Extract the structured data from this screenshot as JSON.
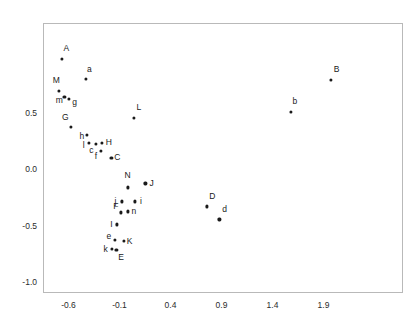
{
  "chart_data": {
    "type": "scatter",
    "title": "",
    "subtitle": "",
    "xlabel": "",
    "ylabel": "",
    "xlim": [
      -0.85,
      2.68
    ],
    "ylim": [
      -1.1,
      1.3
    ],
    "xticks": [
      -0.6,
      -0.1,
      0.4,
      0.9,
      1.4,
      1.9
    ],
    "xticklabels": [
      "-0.6",
      "-0.1",
      "0.4",
      "0.9",
      "1.4",
      "1.9"
    ],
    "yticks": [
      0.5,
      0.0,
      -0.5,
      -1.0
    ],
    "yticklabels": [
      "0.5",
      "0.0",
      "-0.5",
      "-1.0"
    ],
    "grid": false,
    "legend": null,
    "marker": "filled-circle",
    "marker_color": "#1a1a1a",
    "frame_color": "#b9b9b9",
    "points": [
      {
        "label": "A",
        "x": -0.665,
        "y": 0.982,
        "lx": -0.62,
        "ly": 1.08
      },
      {
        "label": "a",
        "x": -0.43,
        "y": 0.804,
        "lx": -0.395,
        "ly": 0.893
      },
      {
        "label": "M",
        "x": -0.695,
        "y": 0.697,
        "lx": -0.72,
        "ly": 0.795
      },
      {
        "label": "m",
        "x": -0.64,
        "y": 0.643,
        "lx": -0.69,
        "ly": 0.616
      },
      {
        "label": "g",
        "x": -0.592,
        "y": 0.625,
        "lx": -0.54,
        "ly": 0.598
      },
      {
        "label": "B",
        "x": 1.97,
        "y": 0.795,
        "lx": 2.03,
        "ly": 0.893
      },
      {
        "label": "b",
        "x": 1.578,
        "y": 0.509,
        "lx": 1.62,
        "ly": 0.607
      },
      {
        "label": "G",
        "x": -0.575,
        "y": 0.375,
        "lx": -0.63,
        "ly": 0.464
      },
      {
        "label": "L",
        "x": 0.04,
        "y": 0.455,
        "lx": 0.09,
        "ly": 0.554
      },
      {
        "label": "h",
        "x": -0.418,
        "y": 0.304,
        "lx": -0.47,
        "ly": 0.295
      },
      {
        "label": "H",
        "x": -0.27,
        "y": 0.232,
        "lx": -0.205,
        "ly": 0.241
      },
      {
        "label": "l",
        "x": -0.398,
        "y": 0.232,
        "lx": -0.45,
        "ly": 0.214
      },
      {
        "label": "c",
        "x": -0.33,
        "y": 0.223,
        "lx": -0.375,
        "ly": 0.17
      },
      {
        "label": "f",
        "x": -0.285,
        "y": 0.161,
        "lx": -0.33,
        "ly": 0.116
      },
      {
        "label": "C",
        "x": -0.18,
        "y": 0.098,
        "lx": -0.12,
        "ly": 0.107
      },
      {
        "label": "N",
        "x": -0.02,
        "y": -0.161,
        "lx": -0.02,
        "ly": -0.054
      },
      {
        "label": "J",
        "x": 0.155,
        "y": -0.125,
        "lx": 0.215,
        "ly": -0.125
      },
      {
        "label": "j",
        "x": -0.08,
        "y": -0.286,
        "lx": -0.14,
        "ly": -0.286
      },
      {
        "label": "i",
        "x": 0.05,
        "y": -0.286,
        "lx": 0.11,
        "ly": -0.286
      },
      {
        "label": "F",
        "x": -0.09,
        "y": -0.384,
        "lx": -0.135,
        "ly": -0.33
      },
      {
        "label": "n",
        "x": -0.02,
        "y": -0.375,
        "lx": 0.04,
        "ly": -0.375
      },
      {
        "label": "D",
        "x": 0.76,
        "y": -0.33,
        "lx": 0.81,
        "ly": -0.241
      },
      {
        "label": "d",
        "x": 0.88,
        "y": -0.446,
        "lx": 0.93,
        "ly": -0.357
      },
      {
        "label": "e",
        "x": -0.148,
        "y": -0.625,
        "lx": -0.205,
        "ly": -0.589
      },
      {
        "label": "K",
        "x": -0.06,
        "y": -0.634,
        "lx": 0.0,
        "ly": -0.634
      },
      {
        "label": "k",
        "x": -0.178,
        "y": -0.705,
        "lx": -0.235,
        "ly": -0.705
      },
      {
        "label": "E",
        "x": -0.13,
        "y": -0.714,
        "lx": -0.085,
        "ly": -0.777
      },
      {
        "label": "I",
        "x": -0.128,
        "y": -0.491,
        "lx": -0.18,
        "ly": -0.491
      }
    ]
  }
}
